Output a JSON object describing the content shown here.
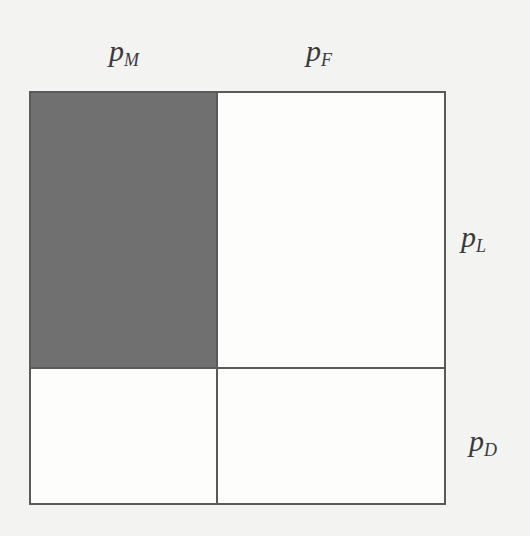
{
  "diagram": {
    "labels": {
      "top_left": {
        "base": "p",
        "subscript": "M"
      },
      "top_right": {
        "base": "p",
        "subscript": "F"
      },
      "right_upper": {
        "base": "p",
        "subscript": "L"
      },
      "right_lower": {
        "base": "p",
        "subscript": "D"
      }
    },
    "partition": {
      "column_split_fraction": 0.45,
      "row_split_fraction": 0.67,
      "shaded_region": "top-left"
    },
    "colors": {
      "shade": "#707070",
      "line": "#5a5a5a",
      "background": "#f3f3f2",
      "box_fill": "#fdfdfc"
    }
  }
}
